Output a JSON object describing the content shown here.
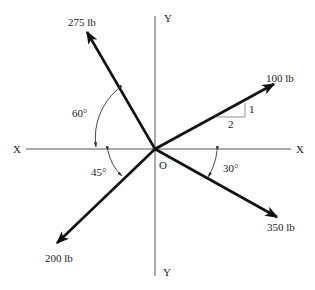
{
  "diagram": {
    "title": "",
    "axes": {
      "x_left_label": "X",
      "x_right_label": "X",
      "y_top_label": "Y",
      "y_bottom_label": "Y",
      "origin_label": "O"
    },
    "forces": [
      {
        "id": "f275",
        "label": "275 lb",
        "magnitude_lb": 275,
        "direction_deg_from_pos_x": 120,
        "reference": "60° from negative X axis"
      },
      {
        "id": "f100",
        "label": "100 lb",
        "magnitude_lb": 100,
        "slope_rise": 1,
        "slope_run": 2,
        "reference": "slope 1:2 above positive X axis"
      },
      {
        "id": "f200",
        "label": "200 lb",
        "magnitude_lb": 200,
        "direction_deg_from_pos_x": 225,
        "reference": "45° below negative X axis"
      },
      {
        "id": "f350",
        "label": "350 lb",
        "magnitude_lb": 350,
        "direction_deg_from_pos_x": -30,
        "reference": "30° below positive X axis"
      }
    ],
    "angles": [
      {
        "id": "a60",
        "label": "60°",
        "value_deg": 60
      },
      {
        "id": "a45",
        "label": "45°",
        "value_deg": 45
      },
      {
        "id": "a30",
        "label": "30°",
        "value_deg": 30
      }
    ],
    "slope_triangle": {
      "rise_label": "1",
      "run_label": "2"
    }
  }
}
